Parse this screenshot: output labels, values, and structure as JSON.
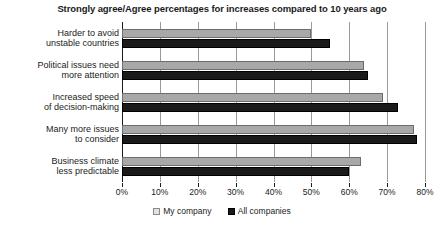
{
  "chart_data": {
    "type": "bar",
    "orientation": "horizontal",
    "title": "Strongly agree/Agree percentages for increases compared to 10 years ago",
    "xlabel": "",
    "ylabel": "",
    "xlim": [
      0,
      80
    ],
    "xticks": [
      0,
      10,
      20,
      30,
      40,
      50,
      60,
      70,
      80
    ],
    "xtick_labels": [
      "0%",
      "10%",
      "20%",
      "30%",
      "40%",
      "50%",
      "60%",
      "70%",
      "80%"
    ],
    "grid": true,
    "legend_position": "bottom",
    "categories": [
      "Harder to avoid unstable countries",
      "Political issues need more attention",
      "Increased speed of decision-making",
      "Many more issues to consider",
      "Business climate less predictable"
    ],
    "category_lines": [
      [
        "Harder to avoid",
        "unstable countries"
      ],
      [
        "Political issues need",
        "more attention"
      ],
      [
        "Increased speed",
        "of decision-making"
      ],
      [
        "Many more issues",
        "to consider"
      ],
      [
        "Business climate",
        "less predictable"
      ]
    ],
    "series": [
      {
        "name": "My company",
        "color": "#a8a8a8",
        "values": [
          50,
          64,
          69,
          77,
          63
        ]
      },
      {
        "name": "All companies",
        "color": "#1a1a1a",
        "values": [
          55,
          65,
          73,
          78,
          60
        ]
      }
    ]
  },
  "legend": {
    "items": [
      {
        "label": "My company"
      },
      {
        "label": "All companies"
      }
    ]
  },
  "footer": {
    "note": ""
  }
}
